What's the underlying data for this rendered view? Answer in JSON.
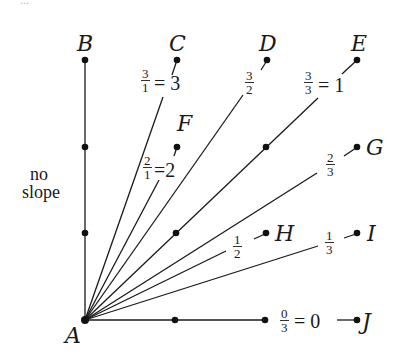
{
  "diagram": {
    "title_fragment": "...",
    "origin": {
      "name": "A",
      "x": 85,
      "y": 320
    },
    "points": [
      {
        "name": "B",
        "x": 85,
        "y": 60,
        "label_x": 78,
        "label_y": 50
      },
      {
        "name": "C",
        "x": 177,
        "y": 60,
        "label_x": 170,
        "label_y": 50
      },
      {
        "name": "D",
        "x": 267,
        "y": 60,
        "label_x": 260,
        "label_y": 50
      },
      {
        "name": "E",
        "x": 357,
        "y": 60,
        "label_x": 350,
        "label_y": 50
      },
      {
        "name": "F",
        "x": 177,
        "y": 147,
        "label_x": 176,
        "label_y": 133
      },
      {
        "name": "G",
        "x": 357,
        "y": 147,
        "label_x": 366,
        "label_y": 155
      },
      {
        "name": "H",
        "x": 266,
        "y": 233,
        "label_x": 276,
        "label_y": 241
      },
      {
        "name": "I",
        "x": 357,
        "y": 233,
        "label_x": 366,
        "label_y": 241
      },
      {
        "name": "J",
        "x": 357,
        "y": 320,
        "label_x": 364,
        "label_y": 328
      }
    ],
    "labels": {
      "A": "A",
      "B": "B",
      "C": "C",
      "D": "D",
      "E": "E",
      "F": "F",
      "G": "G",
      "H": "H",
      "I": "I",
      "J": "J",
      "no_slope_line1": "no",
      "no_slope_line2": "slope"
    },
    "slopes": [
      {
        "to": "B",
        "value": "no slope"
      },
      {
        "to": "C",
        "num": "3",
        "den": "1",
        "equals": "= 3"
      },
      {
        "to": "F",
        "num": "2",
        "den": "1",
        "equals": "=2"
      },
      {
        "to": "D",
        "num": "3",
        "den": "2",
        "equals": ""
      },
      {
        "to": "E",
        "num": "3",
        "den": "3",
        "equals": "= 1"
      },
      {
        "to": "G",
        "num": "2",
        "den": "3",
        "equals": ""
      },
      {
        "to": "H",
        "num": "1",
        "den": "2",
        "equals": ""
      },
      {
        "to": "I",
        "num": "1",
        "den": "3",
        "equals": ""
      },
      {
        "to": "J",
        "num": "0",
        "den": "3",
        "equals": "= 0"
      }
    ],
    "intermediate_dots": [
      {
        "on": "AB",
        "x": 85,
        "y": 147
      },
      {
        "on": "AB",
        "x": 85,
        "y": 233
      },
      {
        "on": "AE",
        "x": 176,
        "y": 233
      },
      {
        "on": "AE",
        "x": 266,
        "y": 147
      },
      {
        "on": "AJ",
        "x": 175,
        "y": 320
      },
      {
        "on": "AJ",
        "x": 265,
        "y": 320
      }
    ],
    "colors": {
      "ink": "#1a1a1a",
      "background": "#ffffff"
    }
  }
}
